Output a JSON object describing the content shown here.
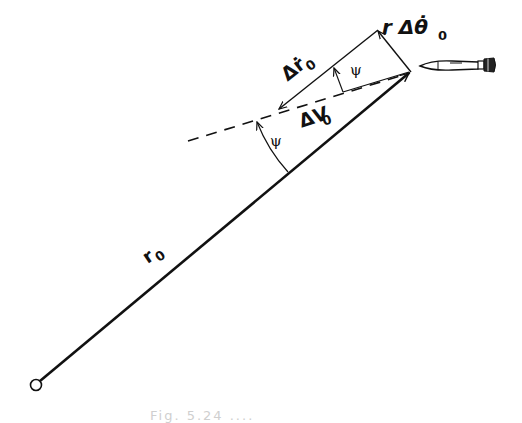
{
  "diagram": {
    "type": "vector-geometry",
    "labels": {
      "range": "r",
      "range_sub": "0",
      "delta_r_dot": "Δṙ",
      "delta_r_dot_sub": "0",
      "delta_v": "ΔV",
      "delta_v_sub": "0",
      "r_delta_theta_dot": "r Δθ̇",
      "r_delta_theta_dot_sub": "0",
      "angle_upper": "ψ",
      "angle_lower": "ψ"
    },
    "caption": "Fig. 5.24  ....",
    "colors": {
      "ink": "#111111",
      "background": "#ffffff"
    }
  }
}
